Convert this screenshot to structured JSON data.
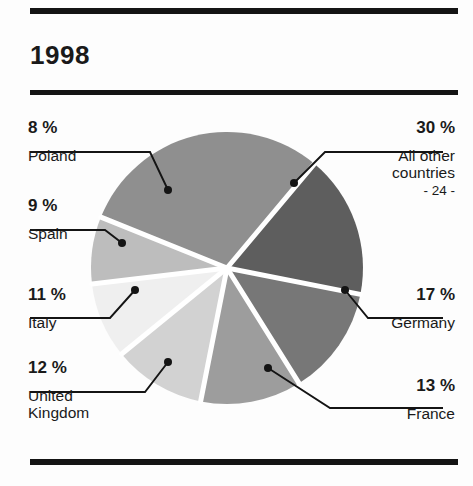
{
  "document": {
    "title": "1998",
    "page_marker": "- 24 -"
  },
  "chart_data": {
    "type": "pie",
    "title": "1998",
    "unit": "%",
    "total": 100,
    "legend_position": "callouts",
    "categories": [
      "All other countries",
      "Germany",
      "France",
      "United Kingdom",
      "Italy",
      "Spain",
      "Poland"
    ],
    "values": [
      30,
      17,
      13,
      12,
      11,
      9,
      8
    ],
    "slices": [
      {
        "label": "All other countries",
        "percent_text": "30 %",
        "value": 30,
        "color": "#8f8f8f",
        "start_angle": -68,
        "end_angle": 40
      },
      {
        "label": "Germany",
        "percent_text": "17 %",
        "value": 17,
        "color": "#5e5e5e",
        "start_angle": 40,
        "end_angle": 101
      },
      {
        "label": "France",
        "percent_text": "13 %",
        "value": 13,
        "color": "#777777",
        "start_angle": 101,
        "end_angle": 148
      },
      {
        "label": "United Kingdom",
        "percent_text": "12 %",
        "value": 12,
        "color": "#9d9d9d",
        "start_angle": 148,
        "end_angle": 191
      },
      {
        "label": "Italy",
        "percent_text": "11 %",
        "value": 11,
        "color": "#d2d2d2",
        "start_angle": 191,
        "end_angle": 231
      },
      {
        "label": "Spain",
        "percent_text": "9 %",
        "value": 9,
        "color": "#efefef",
        "start_angle": 231,
        "end_angle": 263
      },
      {
        "label": "Poland",
        "percent_text": "8 %",
        "value": 8,
        "color": "#bdbdbd",
        "start_angle": 263,
        "end_angle": 292
      }
    ]
  },
  "callouts": {
    "poland": {
      "percent": "8 %",
      "name": "Poland"
    },
    "spain": {
      "percent": "9 %",
      "name": "Spain"
    },
    "italy": {
      "percent": "11 %",
      "name": "Italy"
    },
    "uk": {
      "percent": "12 %",
      "name_line1": "United",
      "name_line2": "Kingdom"
    },
    "allother": {
      "percent": "30 %",
      "name_line1": "All other",
      "name_line2": "countries"
    },
    "germany": {
      "percent": "17 %",
      "name": "Germany"
    },
    "france": {
      "percent": "13 %",
      "name": "France"
    }
  },
  "colors": {
    "ink": "#141414",
    "background": "#fdfdfd",
    "slice_gap": "#ffffff"
  }
}
